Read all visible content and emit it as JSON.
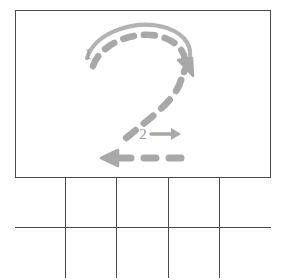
{
  "worksheet": {
    "character": "2",
    "character_name": "digit-two",
    "type": "handwriting stroke-order practice sheet",
    "background_color": "#ffffff",
    "frame_color": "#4a4a4a",
    "stroke_guide_color": "#a8a8a8",
    "stroke_label_color": "#9a9a9a"
  },
  "demo": {
    "label": "2",
    "strokes": [
      {
        "order_label": "1",
        "name": "top-curve-stroke",
        "description": "curved hook from lower-left up over the top and down to the right",
        "direction": "clockwise",
        "arrow": "down-right",
        "style": "dashed with solid leading guide arc"
      },
      {
        "order_label": "2",
        "name": "bottom-horizontal-stroke",
        "description": "horizontal base stroke",
        "direction": "right",
        "arrow": "left",
        "style": "dashed"
      }
    ]
  },
  "practice": {
    "columns": 5,
    "rows": 2,
    "cells": [
      {
        "value": ""
      },
      {
        "value": ""
      },
      {
        "value": ""
      },
      {
        "value": ""
      },
      {
        "value": ""
      },
      {
        "value": ""
      },
      {
        "value": ""
      },
      {
        "value": ""
      },
      {
        "value": ""
      },
      {
        "value": ""
      }
    ]
  }
}
